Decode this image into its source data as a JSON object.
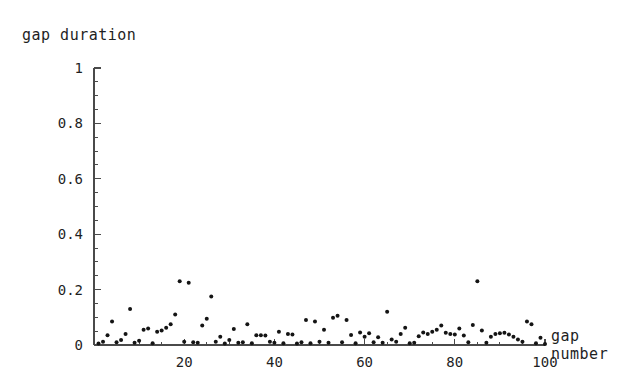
{
  "chart_data": {
    "type": "scatter",
    "title": "gap duration",
    "xlabel_line1": "gap",
    "xlabel_line2": "number",
    "ylabel": "gap duration",
    "xlim": [
      0,
      100
    ],
    "ylim": [
      0,
      1
    ],
    "grid": false,
    "legend": null,
    "x_ticks": [
      20,
      40,
      60,
      80,
      100
    ],
    "x_tick_labels": [
      "20",
      "40",
      "60",
      "80",
      "100"
    ],
    "x_minor_step": 5,
    "y_ticks": [
      0,
      0.2,
      0.4,
      0.6,
      0.8,
      1
    ],
    "y_tick_labels": [
      "0",
      "0.2",
      "0.4",
      "0.6",
      "0.8",
      "1"
    ],
    "y_minor_step": 0.05,
    "marker": "filled-circle",
    "marker_color": "#141414",
    "marker_size_px": 3.2,
    "axis_color": "#4a4a4a",
    "background": "#ffffff",
    "point_count": 100,
    "x": [
      1,
      2,
      3,
      4,
      5,
      6,
      7,
      8,
      9,
      10,
      11,
      12,
      13,
      14,
      15,
      16,
      17,
      18,
      19,
      20,
      21,
      22,
      23,
      24,
      25,
      26,
      27,
      28,
      29,
      30,
      31,
      32,
      33,
      34,
      35,
      36,
      37,
      38,
      39,
      40,
      41,
      42,
      43,
      44,
      45,
      46,
      47,
      48,
      49,
      50,
      51,
      52,
      53,
      54,
      55,
      56,
      57,
      58,
      59,
      60,
      61,
      62,
      63,
      64,
      65,
      66,
      67,
      68,
      69,
      70,
      71,
      72,
      73,
      74,
      75,
      76,
      77,
      78,
      79,
      80,
      81,
      82,
      83,
      84,
      85,
      86,
      87,
      88,
      89,
      90,
      91,
      92,
      93,
      94,
      95,
      96,
      97,
      98,
      99,
      100
    ],
    "y": [
      0.005,
      0.012,
      0.035,
      0.085,
      0.01,
      0.018,
      0.04,
      0.13,
      0.008,
      0.015,
      0.055,
      0.06,
      0.006,
      0.048,
      0.052,
      0.062,
      0.075,
      0.11,
      0.23,
      0.012,
      0.225,
      0.01,
      0.008,
      0.07,
      0.095,
      0.175,
      0.012,
      0.03,
      0.005,
      0.018,
      0.058,
      0.008,
      0.01,
      0.075,
      0.006,
      0.035,
      0.035,
      0.034,
      0.012,
      0.008,
      0.048,
      0.006,
      0.04,
      0.038,
      0.005,
      0.01,
      0.09,
      0.006,
      0.085,
      0.012,
      0.055,
      0.008,
      0.098,
      0.106,
      0.01,
      0.09,
      0.036,
      0.006,
      0.045,
      0.03,
      0.042,
      0.01,
      0.028,
      0.008,
      0.12,
      0.02,
      0.012,
      0.04,
      0.062,
      0.006,
      0.008,
      0.032,
      0.045,
      0.04,
      0.048,
      0.055,
      0.07,
      0.044,
      0.04,
      0.038,
      0.06,
      0.034,
      0.01,
      0.072,
      0.23,
      0.052,
      0.008,
      0.03,
      0.04,
      0.042,
      0.044,
      0.038,
      0.03,
      0.02,
      0.012,
      0.085,
      0.075,
      0.006,
      0.026,
      0.004
    ]
  },
  "axes": {
    "y_axis_name": "y-axis",
    "x_axis_name": "x-axis"
  }
}
